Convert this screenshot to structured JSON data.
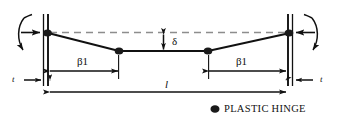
{
  "figure": {
    "labels": {
      "beta_left": "β1",
      "beta_right": "β1",
      "delta": "δ",
      "length": "l",
      "thickness_left": "t",
      "thickness_right": "t"
    },
    "legend": {
      "marker_name": "plastic-hinge-marker",
      "text": "PLASTIC HINGE"
    },
    "colors": {
      "line": "#111111",
      "dashed_reference": "#8d8d8d",
      "wall": "#111111",
      "hinge_fill": "#1a1a1a",
      "background": "#ffffff"
    },
    "geometry": {
      "wall_left_x": 46,
      "wall_right_x": 290,
      "support_y": 33,
      "hinge_inner_left_x": 119,
      "hinge_inner_right_x": 208,
      "hinge_inner_y": 51,
      "deflection_top_y": 33,
      "deflection_bottom_y": 51,
      "dimension_beta_y": 71,
      "dimension_length_y": 92,
      "hinge_radius_x": 4.2,
      "hinge_radius_y": 3.4
    },
    "elements": {
      "rotation_arrow_left": "moment-rotation-arrow-left",
      "rotation_arrow_right": "moment-rotation-arrow-right",
      "load_arrow_left": "support-reaction-arrow-left",
      "load_arrow_right": "support-reaction-arrow-right",
      "dashed_line": "undeformed-reference-line",
      "beam": "deformed-beam-profile"
    }
  }
}
